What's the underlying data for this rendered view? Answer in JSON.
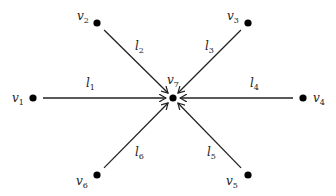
{
  "diagram": {
    "type": "star-graph",
    "stroke_color": "#222222",
    "node_color": "#000000",
    "nodes": [
      {
        "id": "v1",
        "name": "v",
        "sub": "1",
        "x": 33,
        "y": 98,
        "lx": 12,
        "ly": 102
      },
      {
        "id": "v2",
        "name": "v",
        "sub": "2",
        "x": 97,
        "y": 23,
        "lx": 77,
        "ly": 20
      },
      {
        "id": "v3",
        "name": "v",
        "sub": "3",
        "x": 248,
        "y": 23,
        "lx": 227,
        "ly": 20
      },
      {
        "id": "v4",
        "name": "v",
        "sub": "4",
        "x": 303,
        "y": 98,
        "lx": 313,
        "ly": 102
      },
      {
        "id": "v5",
        "name": "v",
        "sub": "5",
        "x": 248,
        "y": 175,
        "lx": 226,
        "ly": 185
      },
      {
        "id": "v6",
        "name": "v",
        "sub": "6",
        "x": 97,
        "y": 175,
        "lx": 76,
        "ly": 185
      },
      {
        "id": "v7",
        "name": "v",
        "sub": "7",
        "x": 173,
        "y": 98,
        "lx": 167,
        "ly": 84
      }
    ],
    "edges": [
      {
        "id": "l1",
        "name": "l",
        "sub": "1",
        "from": "v1",
        "to": "v7",
        "lx": 86,
        "ly": 87
      },
      {
        "id": "l2",
        "name": "l",
        "sub": "2",
        "from": "v2",
        "to": "v7",
        "lx": 135,
        "ly": 50
      },
      {
        "id": "l3",
        "name": "l",
        "sub": "3",
        "from": "v3",
        "to": "v7",
        "lx": 205,
        "ly": 50
      },
      {
        "id": "l4",
        "name": "l",
        "sub": "4",
        "from": "v4",
        "to": "v7",
        "lx": 250,
        "ly": 87
      },
      {
        "id": "l5",
        "name": "l",
        "sub": "5",
        "from": "v5",
        "to": "v7",
        "lx": 207,
        "ly": 156
      },
      {
        "id": "l6",
        "name": "l",
        "sub": "6",
        "from": "v6",
        "to": "v7",
        "lx": 135,
        "ly": 156
      }
    ]
  }
}
